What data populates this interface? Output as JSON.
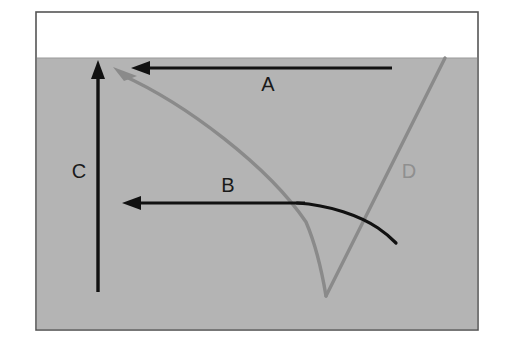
{
  "figure": {
    "canvas": {
      "width": 510,
      "height": 346
    },
    "page_background": "#ffffff",
    "frame": {
      "name": "panel-border",
      "x": 36,
      "y": 12,
      "width": 442,
      "height": 318,
      "stroke": "#555555",
      "stroke_width": 1.6,
      "fill": "#ffffff"
    },
    "bands": [
      {
        "name": "upper-white-band",
        "label": "white layer",
        "x": 37,
        "y": 13,
        "width": 440,
        "height": 45,
        "color": "#ffffff"
      },
      {
        "name": "lower-gray-band",
        "label": "gray layer",
        "x": 37,
        "y": 58,
        "width": 440,
        "height": 271,
        "color": "#b4b4b4"
      }
    ],
    "interface_line": {
      "name": "band-interface",
      "y": 58,
      "x1": 37,
      "x2": 477,
      "color": "#9a9a9a"
    }
  },
  "colors": {
    "black_stroke": "#111111",
    "gray_stroke": "#8a8a8a",
    "gray_fill": "#b4b4b4",
    "white_fill": "#ffffff",
    "frame_stroke": "#555555",
    "label_black": "#1a1a1a",
    "label_gray": "#8f8f8f"
  },
  "labels": [
    {
      "id": "A",
      "text": "A",
      "x": 268,
      "y": 85,
      "color": "#1a1a1a",
      "font_size": 20,
      "describes": "upper-horizontal-arrow"
    },
    {
      "id": "B",
      "text": "B",
      "x": 228,
      "y": 186,
      "color": "#1a1a1a",
      "font_size": 20,
      "describes": "middle-horizontal-arrow"
    },
    {
      "id": "C",
      "text": "C",
      "x": 79,
      "y": 172,
      "color": "#1a1a1a",
      "font_size": 20,
      "describes": "vertical-arrow"
    },
    {
      "id": "D",
      "text": "D",
      "x": 409,
      "y": 172,
      "color": "#8f8f8f",
      "font_size": 20,
      "describes": "gray-v-curve"
    }
  ],
  "arrows": [
    {
      "id": "arrow-a",
      "name": "upper-horizontal-arrow",
      "label": "A",
      "color": "#111111",
      "stroke_width": 3.2,
      "direction": "leftward",
      "from": {
        "x": 392,
        "y": 68
      },
      "to": {
        "x": 133,
        "y": 68
      },
      "head": {
        "length": 17,
        "half_width": 7
      }
    },
    {
      "id": "arrow-b",
      "name": "middle-horizontal-arrow",
      "label": "B",
      "color": "#111111",
      "stroke_width": 3.2,
      "direction": "leftward",
      "from": {
        "x": 305,
        "y": 203
      },
      "to": {
        "x": 124,
        "y": 203
      },
      "head": {
        "length": 17,
        "half_width": 7
      }
    },
    {
      "id": "arrow-c",
      "name": "vertical-arrow",
      "label": "C",
      "color": "#111111",
      "stroke_width": 3.4,
      "direction": "upward",
      "from": {
        "x": 98,
        "y": 292
      },
      "to": {
        "x": 98,
        "y": 62
      },
      "head": {
        "length": 17,
        "half_width": 7
      }
    },
    {
      "id": "arrow-d",
      "name": "gray-curve-arrowhead",
      "label": "D",
      "color": "#8a8a8a",
      "stroke_width": 3.4,
      "direction": "upper-left",
      "to": {
        "x": 117,
        "y": 71
      },
      "head": {
        "length": 20,
        "half_width": 7
      }
    }
  ],
  "curves": [
    {
      "id": "curve-d-left",
      "name": "gray-descending-branch",
      "label": "D",
      "color": "#8a8a8a",
      "stroke_width": 3.4,
      "path": "M 122,75 C 186,104 268,166 306,222 C 318,250 323,278 326,296",
      "description": "gray curve sweeping from upper-left arrowhead down to the V vertex"
    },
    {
      "id": "curve-d-right",
      "name": "gray-ascending-branch",
      "label": "D",
      "color": "#8a8a8a",
      "stroke_width": 3.4,
      "path": "M 326,296 L 445,58",
      "description": "gray straight branch rising from the V vertex to the band interface"
    },
    {
      "id": "curve-b-tail",
      "name": "black-descending-curve",
      "label": "B",
      "color": "#111111",
      "stroke_width": 3.2,
      "path": "M 297,203 C 330,205 360,216 378,228 C 387,234 392,239 396,243",
      "description": "black curve continuing right from the B arrow and bending downward"
    }
  ],
  "annotations": {
    "vertex": {
      "x": 326,
      "y": 296,
      "name": "gray-v-vertex"
    },
    "crossings": [
      {
        "name": "b-curve-crosses-gray-left-branch",
        "x": 303,
        "y": 204
      },
      {
        "name": "b-curve-crosses-gray-right-branch",
        "x": 371,
        "y": 226
      }
    ]
  }
}
